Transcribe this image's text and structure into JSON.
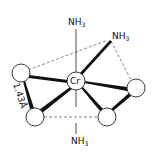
{
  "diagram": {
    "central_atom": {
      "label": "Cr",
      "x": 76,
      "y": 81,
      "r": 9
    },
    "ligands": [
      {
        "id": "nh3-top",
        "label": "NH",
        "sub": "3",
        "x": 68,
        "y": 25
      },
      {
        "id": "nh3-upper-right",
        "label": "NH",
        "sub": "3",
        "x": 112,
        "y": 39
      },
      {
        "id": "nh3-bottom",
        "label": "NH",
        "sub": "3",
        "x": 71,
        "y": 144
      }
    ],
    "ring_atoms": [
      {
        "id": "left",
        "x": 21,
        "y": 73,
        "r": 9
      },
      {
        "id": "lower-left",
        "x": 35,
        "y": 117,
        "r": 9
      },
      {
        "id": "right",
        "x": 136,
        "y": 88,
        "r": 9
      },
      {
        "id": "lower-right",
        "x": 107,
        "y": 117,
        "r": 9
      }
    ],
    "bond_length_label": "1.43Å",
    "colors": {
      "ink": "#111111",
      "background": "#ffffff"
    }
  }
}
